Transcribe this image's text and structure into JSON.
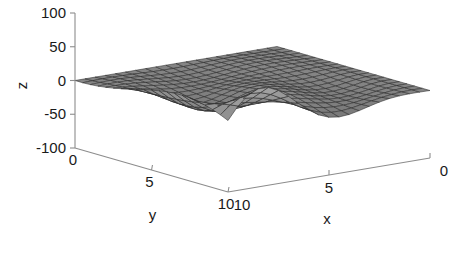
{
  "figure": {
    "title": "",
    "background_color": "#ffffff",
    "axis_color": "#8c8c8c",
    "text_color": "#1a1a1a",
    "mesh_edge_color": "#2b2b2b"
  },
  "axes": {
    "z": {
      "label": "z",
      "ticks": [
        "100",
        "50",
        "0",
        "-50",
        "-100"
      ],
      "tick_values": [
        100,
        50,
        0,
        -50,
        -100
      ],
      "range": [
        -100,
        100
      ]
    },
    "y": {
      "label": "y",
      "ticks": [
        "0",
        "5",
        "10"
      ],
      "tick_values": [
        0,
        5,
        10
      ],
      "range": [
        0,
        10
      ]
    },
    "x": {
      "label": "x",
      "ticks": [
        "10",
        "5",
        "0"
      ],
      "tick_values": [
        10,
        5,
        0
      ],
      "range": [
        0,
        10
      ]
    }
  },
  "chart_data": {
    "type": "surface",
    "title": "",
    "xlabel": "x",
    "ylabel": "y",
    "zlabel": "z",
    "xlim": [
      0,
      10
    ],
    "ylim": [
      0,
      10
    ],
    "zlim": [
      -100,
      100
    ],
    "grid": false,
    "legend": "none",
    "colormap": "gray",
    "view": {
      "azimuth": -37.5,
      "elevation": 22,
      "z_top_tick": "100",
      "z_bottom_tick": "-100"
    },
    "mesh": {
      "x_steps": 20,
      "y_steps": 20,
      "x_start": 0,
      "x_end": 10,
      "y_start": 0,
      "y_end": 10,
      "surface_formula": "z = x * y * sin(x) * cos(y * 0.5) scaled to [-100,100]",
      "description": "Saddle-like sheet rising to z=0 at the y=0,x=0 corner, developing growing oscillating ridges and deep valleys toward larger x and y."
    },
    "annotations": [
      {
        "text": "peak",
        "z": 62,
        "near_x": 1.0,
        "near_y": 8.0
      },
      {
        "text": "valley",
        "z": -95,
        "near_x": 5.0,
        "near_y": 9.5
      },
      {
        "text": "flat origin",
        "z": 0,
        "near_x": 0.0,
        "near_y": 0.0
      }
    ],
    "z_samples": [
      {
        "x": 0,
        "y": 0,
        "z": 0
      },
      {
        "x": 0,
        "y": 5,
        "z": 0
      },
      {
        "x": 0,
        "y": 10,
        "z": 0
      },
      {
        "x": 2.5,
        "y": 0,
        "z": 0
      },
      {
        "x": 2.5,
        "y": 5,
        "z": -18
      },
      {
        "x": 2.5,
        "y": 10,
        "z": -40
      },
      {
        "x": 5,
        "y": 0,
        "z": 0
      },
      {
        "x": 5,
        "y": 5,
        "z": -30
      },
      {
        "x": 5,
        "y": 10,
        "z": -88
      },
      {
        "x": 7.5,
        "y": 0,
        "z": 0
      },
      {
        "x": 7.5,
        "y": 5,
        "z": 22
      },
      {
        "x": 7.5,
        "y": 10,
        "z": 48
      },
      {
        "x": 10,
        "y": 0,
        "z": 0
      },
      {
        "x": 10,
        "y": 5,
        "z": 30
      },
      {
        "x": 10,
        "y": 10,
        "z": 60
      }
    ]
  }
}
